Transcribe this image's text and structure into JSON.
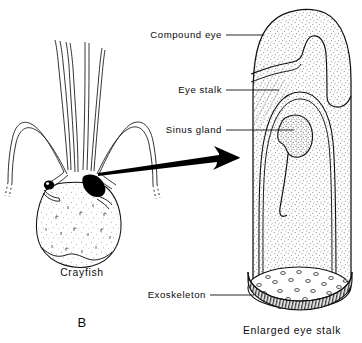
{
  "figure": {
    "panel_letter": "B",
    "background_color": "#ffffff",
    "ink_color": "#111111",
    "stipple_color": "#8a8a8a",
    "width": 362,
    "height": 343
  },
  "captions": [
    {
      "id": "crayfish",
      "text": "Crayfish",
      "x": 82,
      "y": 276
    },
    {
      "id": "enlarged-eye-stalk",
      "text": "Enlarged eye stalk",
      "x": 292,
      "y": 334
    }
  ],
  "labels": [
    {
      "id": "compound-eye",
      "text": "Compound eye",
      "text_x": 222,
      "text_y": 38,
      "leader": {
        "x1": 224,
        "y1": 35,
        "x2": 262,
        "y2": 35
      }
    },
    {
      "id": "eye-stalk",
      "text": "Eye stalk",
      "text_x": 222,
      "text_y": 93,
      "leader": {
        "x1": 224,
        "y1": 90,
        "x2": 276,
        "y2": 90
      }
    },
    {
      "id": "sinus-gland",
      "text": "Sinus gland",
      "text_x": 222,
      "text_y": 133,
      "leader": {
        "x1": 224,
        "y1": 130,
        "x2": 292,
        "y2": 130
      }
    },
    {
      "id": "exoskeleton",
      "text": "Exoskeleton",
      "text_x": 206,
      "text_y": 298,
      "leader": {
        "x1": 209,
        "y1": 295,
        "x2": 253,
        "y2": 295
      }
    }
  ],
  "arrow": {
    "id": "magnify-arrow",
    "description": "arrow from crayfish eye stalk to enlarged diagram",
    "from": {
      "x": 97,
      "y": 172
    },
    "to": {
      "x": 240,
      "y": 152
    }
  },
  "crayfish": {
    "id": "crayfish-drawing",
    "parts": [
      "antennules",
      "antennae",
      "left-eye",
      "right-eye-stalk",
      "carapace"
    ],
    "center_x": 82,
    "top_y": 18,
    "bottom_y": 262
  },
  "eye_stalk": {
    "id": "enlarged-eye-stalk-drawing",
    "parts": [
      "outer-wall",
      "compound-eye-region",
      "sinus-gland",
      "sinus-gland-duct",
      "inner-membrane",
      "exoskeleton-rim",
      "basal-ellipse-pores"
    ],
    "left_x": 247,
    "right_x": 352,
    "top_y": 8,
    "bottom_y": 318
  }
}
